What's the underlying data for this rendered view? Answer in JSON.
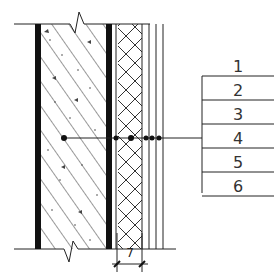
{
  "diagram": {
    "type": "wall-section-detail",
    "layers": [
      {
        "number": "1",
        "description": "inner finish (black line)"
      },
      {
        "number": "2",
        "description": "concrete wall (hatched)"
      },
      {
        "number": "3",
        "description": "membrane (black line)"
      },
      {
        "number": "4",
        "description": "insulation (cross-hatched)"
      },
      {
        "number": "5",
        "description": "thin layer"
      },
      {
        "number": "6",
        "description": "outer finish layers"
      }
    ],
    "legend_labels": [
      "1",
      "2",
      "3",
      "4",
      "5",
      "6"
    ],
    "dimension_label": "7",
    "colors": {
      "line": "#222222",
      "thick_line": "#111111",
      "background": "#ffffff"
    }
  }
}
